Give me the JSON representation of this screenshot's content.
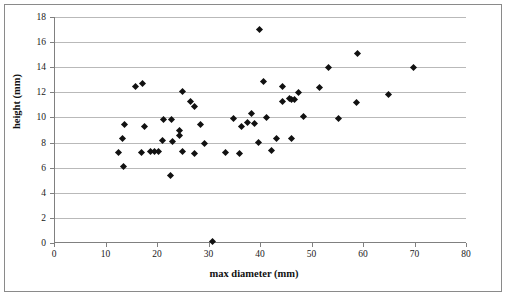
{
  "chart_data": {
    "type": "scatter",
    "title": "",
    "xlabel": "max diameter (mm)",
    "ylabel": "height (mm)",
    "xlim": [
      0,
      80
    ],
    "ylim": [
      0,
      18
    ],
    "xticks": [
      0,
      10,
      20,
      30,
      40,
      50,
      60,
      70,
      80
    ],
    "yticks": [
      0,
      2,
      4,
      6,
      8,
      10,
      12,
      14,
      16,
      18
    ],
    "grid": "horizontal",
    "legend": "none",
    "marker": "diamond",
    "marker_color": "#111111",
    "points": [
      [
        12.3,
        7.2
      ],
      [
        13.1,
        8.3
      ],
      [
        13.3,
        6.1
      ],
      [
        13.4,
        9.4
      ],
      [
        15.7,
        12.5
      ],
      [
        16.8,
        7.2
      ],
      [
        17.0,
        12.7
      ],
      [
        17.3,
        9.3
      ],
      [
        18.5,
        7.3
      ],
      [
        19.3,
        7.3
      ],
      [
        20.1,
        7.3
      ],
      [
        20.8,
        8.2
      ],
      [
        21.1,
        9.8
      ],
      [
        22.5,
        5.4
      ],
      [
        22.6,
        9.8
      ],
      [
        22.8,
        8.1
      ],
      [
        24.1,
        9.0
      ],
      [
        24.1,
        8.6
      ],
      [
        24.8,
        12.1
      ],
      [
        24.8,
        7.3
      ],
      [
        26.3,
        11.3
      ],
      [
        27.0,
        10.9
      ],
      [
        27.0,
        7.1
      ],
      [
        28.3,
        9.4
      ],
      [
        29.0,
        7.9
      ],
      [
        30.5,
        0.1
      ],
      [
        33.1,
        7.2
      ],
      [
        34.6,
        9.9
      ],
      [
        35.8,
        7.1
      ],
      [
        36.3,
        9.3
      ],
      [
        37.4,
        9.6
      ],
      [
        38.2,
        10.3
      ],
      [
        38.8,
        9.5
      ],
      [
        39.5,
        8.0
      ],
      [
        39.7,
        17.0
      ],
      [
        40.4,
        12.9
      ],
      [
        41.1,
        10.0
      ],
      [
        42.0,
        7.4
      ],
      [
        43.0,
        8.3
      ],
      [
        44.1,
        12.5
      ],
      [
        44.2,
        11.3
      ],
      [
        45.5,
        11.5
      ],
      [
        45.9,
        8.3
      ],
      [
        46.0,
        11.4
      ],
      [
        46.5,
        11.4
      ],
      [
        47.2,
        12.0
      ],
      [
        48.3,
        10.1
      ],
      [
        51.4,
        12.4
      ],
      [
        53.2,
        14.0
      ],
      [
        55.0,
        9.9
      ],
      [
        58.6,
        11.2
      ],
      [
        58.8,
        15.1
      ],
      [
        64.8,
        11.8
      ],
      [
        69.7,
        14.0
      ]
    ]
  }
}
